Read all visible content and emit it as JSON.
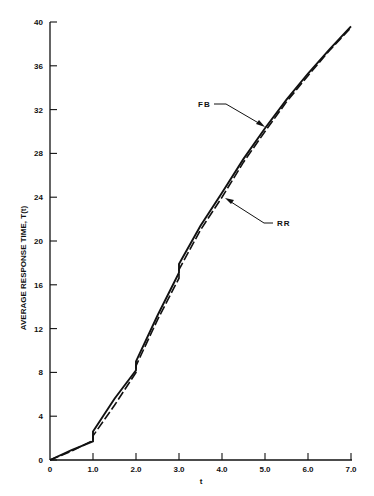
{
  "chart_data": {
    "type": "line",
    "title": "",
    "xlabel": "t",
    "ylabel": "AVERAGE RESPONSE TIME, T(t)",
    "xlim": [
      0,
      7.0
    ],
    "ylim": [
      0,
      40
    ],
    "grid": false,
    "legend_position": "none (inline annotations)",
    "x_ticks": [
      "0",
      "1.0",
      "2.0",
      "3.0",
      "4.0",
      "5.0",
      "6.0",
      "7.0"
    ],
    "y_ticks": [
      "0",
      "4",
      "8",
      "12",
      "16",
      "20",
      "24",
      "28",
      "32",
      "36",
      "40"
    ],
    "series": [
      {
        "name": "FB",
        "style": "solid",
        "x": [
          0,
          0.5,
          1.0,
          1.0,
          1.5,
          2.0,
          2.0,
          2.5,
          3.0,
          3.0,
          3.5,
          4.0,
          4.5,
          5.0,
          5.5,
          6.0,
          6.5,
          7.0
        ],
        "y": [
          0,
          0.9,
          1.7,
          2.6,
          5.6,
          8.2,
          9.0,
          13.2,
          17.1,
          17.9,
          21.4,
          24.4,
          27.5,
          30.3,
          32.9,
          35.3,
          37.5,
          39.6
        ]
      },
      {
        "name": "RR",
        "style": "dashed",
        "x": [
          0,
          0.5,
          1.0,
          1.0,
          1.5,
          2.0,
          2.0,
          2.5,
          3.0,
          3.0,
          3.5,
          4.0,
          4.5,
          5.0,
          5.5,
          6.0,
          6.5,
          7.0
        ],
        "y": [
          0,
          0.8,
          1.8,
          2.2,
          5.0,
          8.0,
          8.6,
          12.8,
          16.6,
          17.4,
          21.0,
          24.0,
          27.2,
          30.0,
          32.7,
          35.1,
          37.4,
          39.5
        ]
      }
    ],
    "annotations": [
      {
        "text": "FB",
        "label_pos": [
          4.0,
          32.5
        ],
        "arrow_to": [
          5.0,
          30.4
        ]
      },
      {
        "text": "RR",
        "label_pos": [
          5.3,
          21.7
        ],
        "arrow_to": [
          4.05,
          24.2
        ]
      }
    ]
  },
  "labels": {
    "ylabel": "AVERAGE RESPONSE TIME, T(t)",
    "xlabel": "t",
    "fb": "FB",
    "rr": "RR"
  }
}
